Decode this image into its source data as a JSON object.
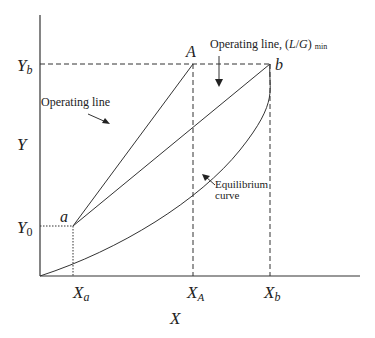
{
  "diagram": {
    "axes": {
      "x_label": "X",
      "y_label": "Y",
      "x_ticks": [
        {
          "main": "X",
          "sub": "a"
        },
        {
          "main": "X",
          "sub": "A"
        },
        {
          "main": "X",
          "sub": "b"
        }
      ],
      "y_ticks": [
        {
          "main": "Y",
          "sub": "b"
        },
        {
          "main": "Y",
          "sub": "0"
        }
      ]
    },
    "points": {
      "a": "a",
      "A": "A",
      "b": "b"
    },
    "annotations": {
      "operating_line": "Operating line",
      "operating_line_min_prefix": "Operating line, (",
      "operating_line_min_L": "L",
      "operating_line_min_slash": "/",
      "operating_line_min_G": "G",
      "operating_line_min_close": ")",
      "operating_line_min_sub": "min",
      "equilibrium_line1": "Equilibrium",
      "equilibrium_line2": "curve"
    },
    "colors": {
      "line": "#2a2a2a"
    }
  }
}
